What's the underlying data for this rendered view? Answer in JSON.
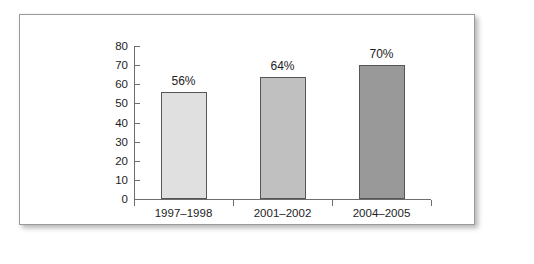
{
  "chart_data": {
    "type": "bar",
    "title": "",
    "subtitle": "",
    "xlabel": "",
    "ylabel": "",
    "categories": [
      "1997–1998",
      "2001–2002",
      "2004–2005"
    ],
    "values": [
      56,
      64,
      70
    ],
    "data_labels": [
      "56%",
      "64%",
      "70%"
    ],
    "ylim": [
      0,
      80
    ],
    "yticks": [
      0,
      10,
      20,
      30,
      40,
      50,
      60,
      70,
      80
    ],
    "ytick_labels": [
      "0",
      "10",
      "20",
      "30",
      "40",
      "50",
      "60",
      "70",
      "80"
    ],
    "grid": false,
    "legend": false,
    "legend_position": "none",
    "bar_colors": [
      "#e0e0e0",
      "#c0c0c0",
      "#999999"
    ],
    "bar_outline_color": "#555555",
    "axis_color": "#6e6e6e",
    "text_color": "#1d1d1d",
    "panel_background": "#ffffff",
    "panel_border_color": "#9a9a9a"
  }
}
